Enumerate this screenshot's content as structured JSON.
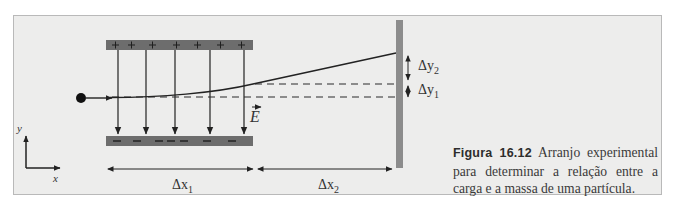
{
  "figure": {
    "number_label": "Figura 16.12",
    "caption_text": " Arranjo experimental para determinar a relação entre a carga e a massa de uma partícula."
  },
  "diagram": {
    "upper_plate": {
      "charge_symbol": "+",
      "count": 7,
      "color": "#6d6d6d"
    },
    "lower_plate": {
      "charge_symbol": "−",
      "count": 7,
      "color": "#6d6d6d"
    },
    "screen_color": "#8c8c8c",
    "field_label": "E",
    "field_line_count": 5,
    "axes": {
      "x_label": "x",
      "y_label": "y"
    },
    "labels": {
      "dx1": "Δx",
      "dx1_sub": "1",
      "dx2": "Δx",
      "dx2_sub": "2",
      "dy1": "Δy",
      "dy1_sub": "1",
      "dy2": "Δy",
      "dy2_sub": "2"
    }
  }
}
